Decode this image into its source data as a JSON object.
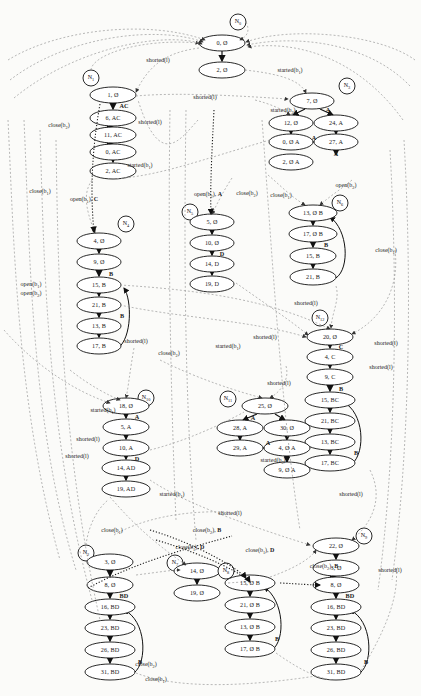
{
  "figure": {
    "type": "state-transition-graph"
  },
  "clusters": [
    {
      "id": "N0",
      "label": "N",
      "sub": "0",
      "cx": 238,
      "cy": 22,
      "nodes": [
        {
          "id": "n0-1",
          "text": "0, Ø",
          "cx": 222,
          "cy": 43,
          "rx": 23,
          "ry": 8
        },
        {
          "id": "n0-2",
          "text": "2, Ø",
          "cx": 222,
          "cy": 70,
          "rx": 23,
          "ry": 8
        }
      ],
      "chain_labels": []
    },
    {
      "id": "N1",
      "label": "N",
      "sub": "1",
      "cx": 91,
      "cy": 78,
      "nodes": [
        {
          "id": "n1-1",
          "text": "1, Ø",
          "cx": 113,
          "cy": 95,
          "rx": 23,
          "ry": 8
        },
        {
          "id": "n1-2",
          "text": "6, AC",
          "cx": 113,
          "cy": 118,
          "rx": 23,
          "ry": 8
        },
        {
          "id": "n1-3",
          "text": "11, AC",
          "cx": 113,
          "cy": 135,
          "rx": 23,
          "ry": 8
        },
        {
          "id": "n1-4",
          "text": "0, AC",
          "cx": 113,
          "cy": 152,
          "rx": 23,
          "ry": 8
        },
        {
          "id": "n1-5",
          "text": "2, AC",
          "cx": 113,
          "cy": 171,
          "rx": 23,
          "ry": 8
        }
      ],
      "chain_labels": [
        {
          "text": "AC",
          "x": 124,
          "y": 106
        }
      ]
    },
    {
      "id": "N3",
      "label": "N",
      "sub": "3",
      "cx": 347,
      "cy": 86,
      "nodes": [
        {
          "id": "n3-1",
          "text": "7, Ø",
          "cx": 312,
          "cy": 101,
          "rx": 22,
          "ry": 8
        },
        {
          "id": "n3-2",
          "text": "12, Ø",
          "cx": 291,
          "cy": 123,
          "rx": 22,
          "ry": 8
        },
        {
          "id": "n3-3",
          "text": "24, A",
          "cx": 336,
          "cy": 123,
          "rx": 22,
          "ry": 8
        },
        {
          "id": "n3-4",
          "text": "0, Ø A",
          "cx": 291,
          "cy": 142,
          "rx": 22,
          "ry": 8
        },
        {
          "id": "n3-5",
          "text": "27, A",
          "cx": 336,
          "cy": 142,
          "rx": 22,
          "ry": 8
        },
        {
          "id": "n3-6",
          "text": "2, Ø A",
          "cx": 291,
          "cy": 162,
          "rx": 22,
          "ry": 8
        }
      ],
      "chain_labels": [
        {
          "text": "A",
          "x": 328,
          "y": 110
        },
        {
          "text": "A",
          "x": 314,
          "y": 138
        },
        {
          "text": "A",
          "x": 336,
          "y": 154
        }
      ]
    },
    {
      "id": "N4",
      "label": "N",
      "sub": "4",
      "cx": 126,
      "cy": 224,
      "nodes": [
        {
          "id": "n4-1",
          "text": "4, Ø",
          "cx": 99,
          "cy": 241,
          "rx": 22,
          "ry": 8
        },
        {
          "id": "n4-2",
          "text": "9, Ø",
          "cx": 99,
          "cy": 262,
          "rx": 22,
          "ry": 8
        },
        {
          "id": "n4-3",
          "text": "15, B",
          "cx": 99,
          "cy": 285,
          "rx": 22,
          "ry": 8
        },
        {
          "id": "n4-4",
          "text": "21, B",
          "cx": 99,
          "cy": 305,
          "rx": 22,
          "ry": 8
        },
        {
          "id": "n4-5",
          "text": "13, B",
          "cx": 99,
          "cy": 326,
          "rx": 22,
          "ry": 8
        },
        {
          "id": "n4-6",
          "text": "17, B",
          "cx": 99,
          "cy": 346,
          "rx": 22,
          "ry": 8
        }
      ],
      "chain_labels": [
        {
          "text": "B",
          "x": 111,
          "y": 274
        },
        {
          "text": "B",
          "x": 122,
          "y": 316
        }
      ]
    },
    {
      "id": "N5",
      "label": "N",
      "sub": "5",
      "cx": 190,
      "cy": 212,
      "nodes": [
        {
          "id": "n5-1",
          "text": "5, Ø",
          "cx": 212,
          "cy": 222,
          "rx": 22,
          "ry": 8
        },
        {
          "id": "n5-2",
          "text": "10, Ø",
          "cx": 212,
          "cy": 243,
          "rx": 22,
          "ry": 8
        },
        {
          "id": "n5-3",
          "text": "14, D",
          "cx": 212,
          "cy": 264,
          "rx": 22,
          "ry": 8
        },
        {
          "id": "n5-4",
          "text": "19, D",
          "cx": 212,
          "cy": 284,
          "rx": 22,
          "ry": 8
        }
      ],
      "chain_labels": [
        {
          "text": "D",
          "x": 222,
          "y": 254
        }
      ]
    },
    {
      "id": "N6",
      "label": "N",
      "sub": "6",
      "cx": 340,
      "cy": 203,
      "nodes": [
        {
          "id": "n6-1",
          "text": "13, Ø B",
          "cx": 313,
          "cy": 213,
          "rx": 24,
          "ry": 8
        },
        {
          "id": "n6-2",
          "text": "17, Ø B",
          "cx": 313,
          "cy": 234,
          "rx": 24,
          "ry": 8
        },
        {
          "id": "n6-3",
          "text": "15, B",
          "cx": 313,
          "cy": 256,
          "rx": 23,
          "ry": 8
        },
        {
          "id": "n6-4",
          "text": "21, B",
          "cx": 313,
          "cy": 277,
          "rx": 23,
          "ry": 8
        }
      ],
      "chain_labels": [
        {
          "text": "B",
          "x": 326,
          "y": 245
        }
      ]
    },
    {
      "id": "N12",
      "label": "N",
      "sub": "12",
      "cx": 320,
      "cy": 318,
      "nodes": [
        {
          "id": "n12-1",
          "text": "20, Ø",
          "cx": 330,
          "cy": 337,
          "rx": 23,
          "ry": 8
        },
        {
          "id": "n12-2",
          "text": "4, C",
          "cx": 330,
          "cy": 357,
          "rx": 23,
          "ry": 8
        },
        {
          "id": "n12-3",
          "text": "9, C",
          "cx": 330,
          "cy": 377,
          "rx": 23,
          "ry": 8
        },
        {
          "id": "n12-4",
          "text": "15, BC",
          "cx": 330,
          "cy": 400,
          "rx": 25,
          "ry": 8
        },
        {
          "id": "n12-5",
          "text": "21, BC",
          "cx": 330,
          "cy": 421,
          "rx": 25,
          "ry": 8
        },
        {
          "id": "n12-6",
          "text": "13, BC",
          "cx": 330,
          "cy": 442,
          "rx": 25,
          "ry": 8
        },
        {
          "id": "n12-7",
          "text": "17, BC",
          "cx": 330,
          "cy": 463,
          "rx": 25,
          "ry": 8
        }
      ],
      "chain_labels": [
        {
          "text": "C",
          "x": 341,
          "y": 347
        },
        {
          "text": "B",
          "x": 341,
          "y": 389
        },
        {
          "text": "B",
          "x": 356,
          "y": 453
        }
      ]
    },
    {
      "id": "N10",
      "label": "N",
      "sub": "10",
      "cx": 146,
      "cy": 398,
      "nodes": [
        {
          "id": "n10-1",
          "text": "18, Ø",
          "cx": 126,
          "cy": 406,
          "rx": 23,
          "ry": 8
        },
        {
          "id": "n10-2",
          "text": "5, A",
          "cx": 126,
          "cy": 427,
          "rx": 23,
          "ry": 8
        },
        {
          "id": "n10-3",
          "text": "10, A",
          "cx": 126,
          "cy": 448,
          "rx": 23,
          "ry": 8
        },
        {
          "id": "n10-4",
          "text": "14, AD",
          "cx": 126,
          "cy": 468,
          "rx": 24,
          "ry": 8
        },
        {
          "id": "n10-5",
          "text": "19, AD",
          "cx": 126,
          "cy": 489,
          "rx": 24,
          "ry": 8
        }
      ],
      "chain_labels": [
        {
          "text": "A",
          "x": 137,
          "y": 417
        },
        {
          "text": "D",
          "x": 137,
          "y": 459
        }
      ]
    },
    {
      "id": "N11",
      "label": "N",
      "sub": "11",
      "cx": 228,
      "cy": 399,
      "nodes": [
        {
          "id": "n11-1",
          "text": "25, Ø",
          "cx": 265,
          "cy": 406,
          "rx": 23,
          "ry": 8
        },
        {
          "id": "n11-2",
          "text": "28, A",
          "cx": 240,
          "cy": 428,
          "rx": 23,
          "ry": 8
        },
        {
          "id": "n11-3",
          "text": "30, Ø",
          "cx": 287,
          "cy": 428,
          "rx": 23,
          "ry": 8
        },
        {
          "id": "n11-4",
          "text": "29, A",
          "cx": 240,
          "cy": 448,
          "rx": 23,
          "ry": 8
        },
        {
          "id": "n11-5",
          "text": "4, Ø A",
          "cx": 287,
          "cy": 448,
          "rx": 23,
          "ry": 8
        },
        {
          "id": "n11-6",
          "text": "9, Ø A",
          "cx": 287,
          "cy": 470,
          "rx": 23,
          "ry": 8
        }
      ],
      "chain_labels": [
        {
          "text": "A",
          "x": 253,
          "y": 418
        },
        {
          "text": "A",
          "x": 268,
          "y": 443
        }
      ]
    },
    {
      "id": "N2",
      "label": "N",
      "sub": "2",
      "cx": 86,
      "cy": 553,
      "nodes": [
        {
          "id": "n2-1",
          "text": "3, Ø",
          "cx": 110,
          "cy": 562,
          "rx": 23,
          "ry": 8
        },
        {
          "id": "n2-2",
          "text": "8, Ø",
          "cx": 110,
          "cy": 585,
          "rx": 23,
          "ry": 8
        },
        {
          "id": "n2-3",
          "text": "16, BD",
          "cx": 110,
          "cy": 607,
          "rx": 25,
          "ry": 8
        },
        {
          "id": "n2-4",
          "text": "23, BD",
          "cx": 110,
          "cy": 628,
          "rx": 25,
          "ry": 8
        },
        {
          "id": "n2-5",
          "text": "26, BD",
          "cx": 110,
          "cy": 650,
          "rx": 25,
          "ry": 8
        },
        {
          "id": "n2-6",
          "text": "31, BD",
          "cx": 110,
          "cy": 672,
          "rx": 25,
          "ry": 8
        }
      ],
      "chain_labels": [
        {
          "text": "BD",
          "x": 124,
          "y": 596
        },
        {
          "text": "B",
          "x": 140,
          "y": 662
        }
      ]
    },
    {
      "id": "N7",
      "label": "N",
      "sub": "7",
      "cx": 175,
      "cy": 563,
      "nodes": [
        {
          "id": "n7-1",
          "text": "14, Ø",
          "cx": 197,
          "cy": 571,
          "rx": 23,
          "ry": 8
        },
        {
          "id": "n7-2",
          "text": "19, Ø",
          "cx": 197,
          "cy": 593,
          "rx": 23,
          "ry": 8
        }
      ],
      "chain_labels": []
    },
    {
      "id": "N8",
      "label": "N",
      "sub": "8",
      "cx": 226,
      "cy": 571,
      "nodes": [
        {
          "id": "n8-1",
          "text": "15, Ø B",
          "cx": 250,
          "cy": 583,
          "rx": 25,
          "ry": 8
        },
        {
          "id": "n8-2",
          "text": "21, Ø B",
          "cx": 250,
          "cy": 605,
          "rx": 25,
          "ry": 8
        },
        {
          "id": "n8-3",
          "text": "13, Ø B",
          "cx": 250,
          "cy": 627,
          "rx": 25,
          "ry": 8
        },
        {
          "id": "n8-4",
          "text": "17, Ø B",
          "cx": 250,
          "cy": 649,
          "rx": 25,
          "ry": 8
        }
      ],
      "chain_labels": [
        {
          "text": "B",
          "x": 277,
          "y": 639
        }
      ]
    },
    {
      "id": "N9",
      "label": "N",
      "sub": "9",
      "cx": 364,
      "cy": 536,
      "nodes": [
        {
          "id": "n9-1",
          "text": "22, Ø",
          "cx": 336,
          "cy": 546,
          "rx": 23,
          "ry": 8
        },
        {
          "id": "n9-2",
          "text": "3, Ø",
          "cx": 336,
          "cy": 568,
          "rx": 23,
          "ry": 8
        },
        {
          "id": "n9-3",
          "text": "8, Ø",
          "cx": 336,
          "cy": 585,
          "rx": 23,
          "ry": 8
        },
        {
          "id": "n9-4",
          "text": "16, BD",
          "cx": 336,
          "cy": 607,
          "rx": 25,
          "ry": 8
        },
        {
          "id": "n9-5",
          "text": "23, BD",
          "cx": 336,
          "cy": 628,
          "rx": 25,
          "ry": 8
        },
        {
          "id": "n9-6",
          "text": "26, BD",
          "cx": 336,
          "cy": 650,
          "rx": 25,
          "ry": 8
        },
        {
          "id": "n9-7",
          "text": "31, BD",
          "cx": 336,
          "cy": 672,
          "rx": 25,
          "ry": 8
        }
      ],
      "chain_labels": [
        {
          "text": "BD",
          "x": 350,
          "y": 596
        },
        {
          "text": "B",
          "x": 366,
          "y": 662
        }
      ]
    }
  ],
  "edge_labels": [
    {
      "id": "el1",
      "text": "shorted(l)",
      "x": 158,
      "y": 60
    },
    {
      "id": "el2",
      "text": "started(b₁)",
      "x": 290,
      "y": 71
    },
    {
      "id": "el3",
      "text": "shorted(l)",
      "x": 205,
      "y": 97
    },
    {
      "id": "el4",
      "text": "started(b₂)",
      "x": 283,
      "y": 111
    },
    {
      "id": "el5",
      "text": "close(b₂)",
      "x": 59,
      "y": 126
    },
    {
      "id": "el6",
      "text": "shorted(l)",
      "x": 150,
      "y": 122
    },
    {
      "id": "el7",
      "text": "started(b₁)",
      "x": 140,
      "y": 166
    },
    {
      "id": "el8",
      "text": "close(b₁)",
      "x": 40,
      "y": 192
    },
    {
      "id": "el9",
      "text": "open(b₁), C",
      "x": 84,
      "y": 200
    },
    {
      "id": "el10",
      "text": "open(b₂), A",
      "x": 208,
      "y": 195
    },
    {
      "id": "el11",
      "text": "close(b₂)",
      "x": 247,
      "y": 194
    },
    {
      "id": "el12",
      "text": "close(b₁)",
      "x": 281,
      "y": 196
    },
    {
      "id": "el13",
      "text": "open(b₂)",
      "x": 346,
      "y": 186
    },
    {
      "id": "el14",
      "text": "open(b₁)",
      "x": 31,
      "y": 285
    },
    {
      "id": "el15",
      "text": "open(b₂)",
      "x": 31,
      "y": 294
    },
    {
      "id": "el16",
      "text": "close(b₁)",
      "x": 386,
      "y": 251
    },
    {
      "id": "el17",
      "text": "shorted(l)",
      "x": 306,
      "y": 303
    },
    {
      "id": "el18",
      "text": "shorted(l)",
      "x": 136,
      "y": 341
    },
    {
      "id": "el19",
      "text": "close(b₂)",
      "x": 169,
      "y": 354
    },
    {
      "id": "el20",
      "text": "started(b₁)",
      "x": 228,
      "y": 347
    },
    {
      "id": "el21",
      "text": "shorted(l)",
      "x": 265,
      "y": 337
    },
    {
      "id": "el22",
      "text": "shorted(l)",
      "x": 386,
      "y": 343
    },
    {
      "id": "el23",
      "text": "shorted(l)",
      "x": 381,
      "y": 367
    },
    {
      "id": "el24",
      "text": "shorted(l)",
      "x": 279,
      "y": 383
    },
    {
      "id": "el25",
      "text": "started(b₁)",
      "x": 103,
      "y": 411
    },
    {
      "id": "el26",
      "text": "shorted(l)",
      "x": 88,
      "y": 439
    },
    {
      "id": "el27",
      "text": "shorted(l)",
      "x": 77,
      "y": 456
    },
    {
      "id": "el28",
      "text": "started(b₂)",
      "x": 273,
      "y": 461
    },
    {
      "id": "el29",
      "text": "started(b₁)",
      "x": 172,
      "y": 495
    },
    {
      "id": "el30",
      "text": "shorted(l)",
      "x": 351,
      "y": 494
    },
    {
      "id": "el31",
      "text": "shorted(l)",
      "x": 230,
      "y": 513
    },
    {
      "id": "el32",
      "text": "close(b₁)",
      "x": 112,
      "y": 531
    },
    {
      "id": "el33",
      "text": "close(b₂), B",
      "x": 207,
      "y": 531
    },
    {
      "id": "el34",
      "text": "close(b₁), D",
      "x": 190,
      "y": 548
    },
    {
      "id": "el35",
      "text": "close(b₁), D",
      "x": 260,
      "y": 551
    },
    {
      "id": "el36",
      "text": "close(b₂), B",
      "x": 324,
      "y": 567
    },
    {
      "id": "el37",
      "text": "shorted(l)",
      "x": 390,
      "y": 570
    },
    {
      "id": "el38",
      "text": "close(b₁)",
      "x": 156,
      "y": 680
    },
    {
      "id": "el39",
      "text": "close(b₂)",
      "x": 146,
      "y": 665
    }
  ],
  "colors": {
    "node_stroke": "#1a1a1a",
    "edge_dashed": "#8c8c8c",
    "edge_dotted_bold": "#222222",
    "background": "#fbfbf9"
  }
}
